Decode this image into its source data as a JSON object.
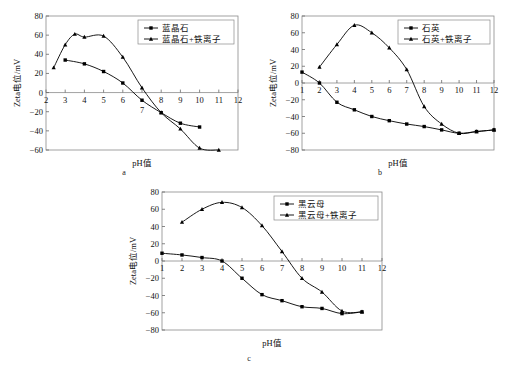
{
  "figure": {
    "axis_x_label": "pH值",
    "axis_y_label": "Zeta电位/mV"
  },
  "panels": [
    {
      "id": "a",
      "caption": "a",
      "legend": [
        "蓝晶石",
        "蓝晶石+铁离子"
      ]
    },
    {
      "id": "b",
      "caption": "b",
      "legend": [
        "石英",
        "石英+铁离子"
      ]
    },
    {
      "id": "c",
      "caption": "c",
      "legend": [
        "黑云母",
        "黑云母+铁离子"
      ]
    }
  ],
  "chart_data": [
    {
      "type": "line",
      "id": "a",
      "title": "蓝晶石",
      "xlabel": "pH值",
      "ylabel": "Zeta电位/mV",
      "xlim": [
        2,
        12
      ],
      "ylim": [
        -60,
        80
      ],
      "xticks": [
        2,
        3,
        4,
        5,
        6,
        7,
        8,
        9,
        10,
        11,
        12
      ],
      "yticks": [
        -60,
        -40,
        -20,
        0,
        20,
        40,
        60,
        80
      ],
      "grid": false,
      "legend_position": "top-right",
      "series": [
        {
          "name": "蓝晶石",
          "marker": "square",
          "x": [
            3,
            4,
            5,
            6,
            7,
            8,
            9,
            10
          ],
          "y": [
            34,
            30,
            22,
            10,
            -8,
            -21,
            -32,
            -36
          ]
        },
        {
          "name": "蓝晶石+铁离子",
          "marker": "triangle",
          "x": [
            2.4,
            3,
            3.5,
            4,
            5,
            6,
            7,
            8,
            9,
            10,
            11
          ],
          "y": [
            26,
            50,
            61,
            58,
            59,
            37,
            5,
            -21,
            -38,
            -58,
            -60
          ]
        }
      ]
    },
    {
      "type": "line",
      "id": "b",
      "title": "石英",
      "xlabel": "pH值",
      "ylabel": "Zeta电位/mV",
      "xlim": [
        1,
        12
      ],
      "ylim": [
        -80,
        80
      ],
      "xticks": [
        1,
        2,
        3,
        4,
        5,
        6,
        7,
        8,
        9,
        10,
        11,
        12
      ],
      "yticks": [
        -80,
        -60,
        -40,
        -20,
        0,
        20,
        40,
        60,
        80
      ],
      "grid": false,
      "legend_position": "top-right",
      "series": [
        {
          "name": "石英",
          "marker": "square",
          "x": [
            1,
            2,
            3,
            4,
            5,
            6,
            7,
            8,
            9,
            10,
            11,
            12
          ],
          "y": [
            13,
            0,
            -23,
            -32,
            -40,
            -45,
            -49,
            -52,
            -56,
            -60,
            -58,
            -56
          ]
        },
        {
          "name": "石英+铁离子",
          "marker": "triangle",
          "x": [
            2,
            3,
            4,
            5,
            6,
            7,
            8,
            9,
            10,
            11,
            12
          ],
          "y": [
            19,
            46,
            69,
            60,
            42,
            16,
            -28,
            -49,
            -60,
            -58,
            -56
          ]
        }
      ]
    },
    {
      "type": "line",
      "id": "c",
      "title": "黑云母",
      "xlabel": "pH值",
      "ylabel": "Zeta电位/mV",
      "xlim": [
        1,
        12
      ],
      "ylim": [
        -80,
        80
      ],
      "xticks": [
        1,
        2,
        3,
        4,
        5,
        6,
        7,
        8,
        9,
        10,
        11,
        12
      ],
      "yticks": [
        -80,
        -60,
        -40,
        -20,
        0,
        20,
        40,
        60,
        80
      ],
      "grid": false,
      "legend_position": "top-right",
      "series": [
        {
          "name": "黑云母",
          "marker": "square",
          "x": [
            1,
            2,
            3,
            4,
            5,
            6,
            7,
            8,
            9,
            10,
            11
          ],
          "y": [
            9,
            7,
            4,
            0,
            -20,
            -39,
            -46,
            -53,
            -55,
            -61,
            -59
          ]
        },
        {
          "name": "黑云母+铁离子",
          "marker": "triangle",
          "x": [
            2,
            3,
            4,
            5,
            6,
            7,
            8,
            9,
            10,
            11
          ],
          "y": [
            45,
            60,
            68,
            62,
            41,
            11,
            -20,
            -36,
            -58,
            -59
          ]
        }
      ]
    }
  ]
}
